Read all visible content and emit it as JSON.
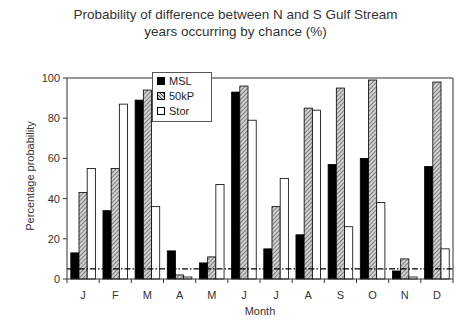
{
  "chart_data": {
    "type": "bar",
    "title": "Probability of difference between N and S Gulf Stream years occurring by chance (%)",
    "title_lines": [
      "Probability of difference between N and S Gulf Stream",
      "years occurring by chance (%)"
    ],
    "xlabel": "Month",
    "ylabel": "Percentage probability",
    "ylim": [
      0,
      100
    ],
    "yticks": [
      0,
      20,
      40,
      60,
      80,
      100
    ],
    "categories": [
      "J",
      "F",
      "M",
      "A",
      "M",
      "J",
      "J",
      "A",
      "S",
      "O",
      "N",
      "D"
    ],
    "series": [
      {
        "name": "MSL",
        "fill": "#000000",
        "values": [
          13,
          34,
          89,
          14,
          8,
          93,
          15,
          22,
          57,
          60,
          4,
          56
        ]
      },
      {
        "name": "50kP",
        "fill": "hatched",
        "values": [
          43,
          55,
          94,
          2,
          11,
          96,
          36,
          85,
          95,
          99,
          10,
          98
        ]
      },
      {
        "name": "Stor",
        "fill": "#ffffff",
        "values": [
          55,
          87,
          36,
          1,
          47,
          79,
          50,
          84,
          26,
          38,
          1,
          15
        ]
      }
    ],
    "reference_line": {
      "y": 5,
      "style": "dash-dot"
    },
    "legend_position": "upper-left-inside",
    "grid": false
  }
}
